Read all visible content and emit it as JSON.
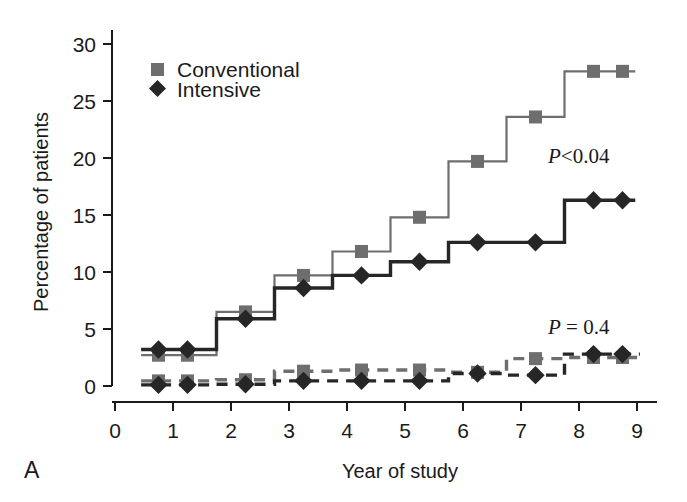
{
  "figure": {
    "panel_label": "A",
    "background": "#ffffff"
  },
  "chart_data": {
    "type": "line",
    "title": "",
    "subtitle": "",
    "xlabel": "Year of study",
    "ylabel": "Percentage of patients",
    "xlim": [
      0,
      9.5
    ],
    "ylim": [
      0,
      31.5
    ],
    "xticks": [
      0,
      1,
      2,
      3,
      4,
      5,
      6,
      7,
      8,
      9
    ],
    "xticklabels": [
      "0",
      "1",
      "2",
      "3",
      "4",
      "5",
      "6",
      "7",
      "8",
      "9"
    ],
    "yticks": [
      0,
      5,
      10,
      15,
      20,
      25,
      30
    ],
    "yticklabels": [
      "0",
      "5",
      "10",
      "15",
      "20",
      "25",
      "30"
    ],
    "grid": false,
    "legend_position": "upper-left-inside",
    "step_style": "post",
    "x": [
      0.75,
      1.25,
      2.25,
      3.25,
      4.25,
      5.25,
      6.25,
      7.25,
      8.25,
      8.75
    ],
    "series": [
      {
        "name": "Conventional",
        "group": "upper",
        "marker": "square",
        "color": "#6e6e6e",
        "linestyle": "solid",
        "values": [
          2.7,
          2.7,
          6.5,
          9.7,
          11.8,
          14.8,
          19.7,
          23.6,
          27.6,
          27.6
        ]
      },
      {
        "name": "Intensive",
        "group": "upper",
        "marker": "diamond",
        "color": "#262626",
        "linestyle": "solid",
        "values": [
          3.2,
          3.2,
          5.9,
          8.6,
          9.7,
          10.9,
          12.6,
          12.6,
          16.3,
          16.3
        ]
      },
      {
        "name": "Conventional",
        "group": "lower",
        "marker": "square",
        "color": "#6e6e6e",
        "linestyle": "dashed",
        "values": [
          0.45,
          0.45,
          0.55,
          1.3,
          1.4,
          1.4,
          1.2,
          2.4,
          2.5,
          2.5
        ]
      },
      {
        "name": "Intensive",
        "group": "lower",
        "marker": "diamond",
        "color": "#262626",
        "linestyle": "dashed",
        "values": [
          0.1,
          0.1,
          0.15,
          0.45,
          0.45,
          0.45,
          1.1,
          0.95,
          2.8,
          2.8
        ]
      }
    ],
    "legend": [
      {
        "label": "Conventional",
        "marker": "square",
        "color": "#6e6e6e"
      },
      {
        "label": "Intensive",
        "marker": "diamond",
        "color": "#262626"
      }
    ],
    "annotations": [
      {
        "name": "p-value-upper",
        "text": "P<0.04",
        "italic_prefix": "P",
        "rest": "<0.04",
        "x": 6.55,
        "y": 18.5
      },
      {
        "name": "p-value-lower",
        "text": "P = 0.4",
        "italic_prefix": "P",
        "rest": " = 0.4",
        "x": 6.55,
        "y": 5.1
      }
    ]
  }
}
